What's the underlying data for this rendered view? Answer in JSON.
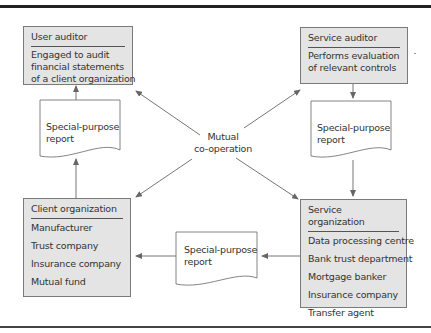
{
  "diagram": {
    "type": "flow",
    "center_label": [
      "Mutual",
      "co-operation"
    ],
    "boxes": {
      "user_auditor": {
        "title": "User auditor",
        "lines": [
          "Engaged to audit",
          "financial statements",
          "of a client organization"
        ]
      },
      "service_auditor": {
        "title": "Service auditor",
        "lines": [
          "Performs evaluation",
          "of relevant controls"
        ]
      },
      "client_organization": {
        "title": "Client organization",
        "lines": [
          "Manufacturer",
          "Trust company",
          "Insurance company",
          "Mutual fund"
        ]
      },
      "service_organization": {
        "title": "Service organization",
        "lines": [
          "Data processing centre",
          "Bank trust department",
          "Mortgage banker",
          "Insurance company",
          "Transfer agent"
        ]
      }
    },
    "reports": {
      "left": [
        "Special-purpose",
        "report"
      ],
      "right": [
        "Special-purpose",
        "report"
      ],
      "bottom": [
        "Special-purpose",
        "report"
      ]
    },
    "edges": [
      {
        "from": "service_auditor",
        "to": "special-purpose report (right)"
      },
      {
        "from": "special-purpose report (right)",
        "to": "service_organization"
      },
      {
        "from": "service_organization",
        "to": "special-purpose report (bottom)"
      },
      {
        "from": "special-purpose report (bottom)",
        "to": "client_organization"
      },
      {
        "from": "client_organization",
        "to": "special-purpose report (left)"
      },
      {
        "from": "special-purpose report (left)",
        "to": "user_auditor"
      },
      {
        "from": "mutual co-operation",
        "to": "user_auditor"
      },
      {
        "from": "mutual co-operation",
        "to": "service_auditor"
      },
      {
        "from": "mutual co-operation",
        "to": "client_organization"
      },
      {
        "from": "mutual co-operation",
        "to": "service_organization"
      }
    ],
    "colors": {
      "box_fill": "#e4e4e4",
      "box_border": "#7a7a7a",
      "line": "#666666"
    }
  }
}
